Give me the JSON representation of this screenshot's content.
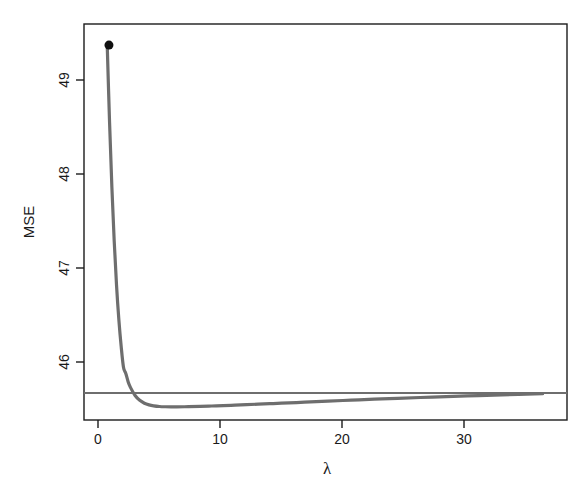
{
  "chart_data": {
    "type": "line",
    "title": "",
    "subtitle": "",
    "xlabel": "λ",
    "ylabel": "MSE",
    "xlim": [
      -2.0,
      39.6
    ],
    "ylim": [
      45.49,
      49.62
    ],
    "xticks": [
      0,
      10,
      20,
      30
    ],
    "xtick_labels": [
      "0",
      "10",
      "20",
      "30"
    ],
    "yticks": [
      46,
      47,
      48,
      49
    ],
    "ytick_labels": [
      "46",
      "47",
      "48",
      "49"
    ],
    "grid": false,
    "legend": null,
    "series": [
      {
        "name": "Ridge MSE curve",
        "color": "#6e6e6e",
        "linewidth": 3.2,
        "x": [
          0.0,
          0.2,
          0.4,
          0.6,
          0.8,
          1.0,
          1.2,
          1.4,
          1.6,
          1.8,
          2.0,
          2.4,
          2.8,
          3.2,
          3.6,
          4.0,
          4.5,
          5.0,
          5.5,
          6.0,
          7.0,
          8.0,
          9.0,
          10.0,
          11.0,
          12.0,
          13.0,
          14.0,
          15.0,
          17.0,
          19.0,
          21.0,
          23.0,
          25.0,
          28.0,
          31.0,
          34.0,
          37.5
        ],
        "y": [
          49.4,
          48.6,
          47.92,
          47.36,
          46.9,
          46.54,
          46.26,
          46.04,
          45.975,
          45.89,
          45.83,
          45.745,
          45.695,
          45.665,
          45.648,
          45.638,
          45.631,
          45.628,
          45.627,
          45.627,
          45.629,
          45.632,
          45.636,
          45.64,
          45.645,
          45.65,
          45.655,
          45.66,
          45.665,
          45.676,
          45.687,
          45.697,
          45.707,
          45.716,
          45.729,
          45.741,
          45.752,
          45.765
        ]
      },
      {
        "name": "OLS reference MSE",
        "color": "#6e6e6e",
        "linewidth": 2.0,
        "type": "hline",
        "y_value": 45.772
      }
    ],
    "annotations": [
      {
        "name": "minimum-lambda-marker",
        "label": "",
        "x": 0.15,
        "y": 49.4,
        "marker": "filled-circle",
        "color": "#101010",
        "size": 9
      }
    ]
  },
  "axes": {
    "y_axis_title": "MSE",
    "x_axis_title": "λ",
    "x_tick_labels": [
      "0",
      "10",
      "20",
      "30"
    ],
    "y_tick_labels": [
      "46",
      "47",
      "48",
      "49"
    ]
  },
  "colors": {
    "curve": "#6e6e6e",
    "reference_line": "#6e6e6e",
    "marker": "#101010",
    "frame": "#1c1c1c",
    "background": "#ffffff",
    "text": "#1a1a1a"
  }
}
